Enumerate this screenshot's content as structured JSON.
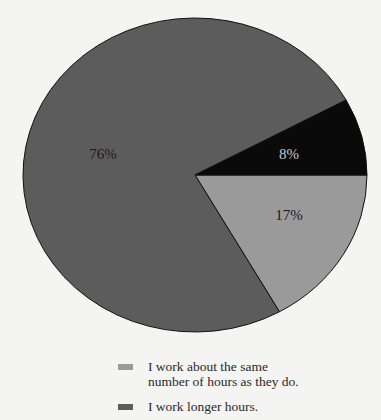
{
  "chart_data": {
    "type": "pie",
    "title": "",
    "slices": [
      {
        "label": "I work longer hours.",
        "value": 76,
        "display": "76%",
        "color": "#5c5c5c",
        "label_color": "#1a1a1a",
        "label_pos": [
          103,
          154
        ]
      },
      {
        "label": "",
        "value": 8,
        "display": "8%",
        "color": "#0a0a0a",
        "label_color": "#c8c8c8",
        "label_pos": [
          289,
          154
        ]
      },
      {
        "label": "I work about the same number of hours as they do.",
        "value": 17,
        "display": "17%",
        "color": "#9a9a9a",
        "label_color": "#1a1a1a",
        "label_pos": [
          289,
          215
        ]
      }
    ],
    "legend_position": "bottom"
  },
  "legend": {
    "items": [
      {
        "line1": "I work about the same",
        "line2": "number of hours as they do.",
        "color": "#9a9a9a"
      },
      {
        "line1": "I work longer hours.",
        "line2": "",
        "color": "#5c5c5c"
      }
    ]
  }
}
